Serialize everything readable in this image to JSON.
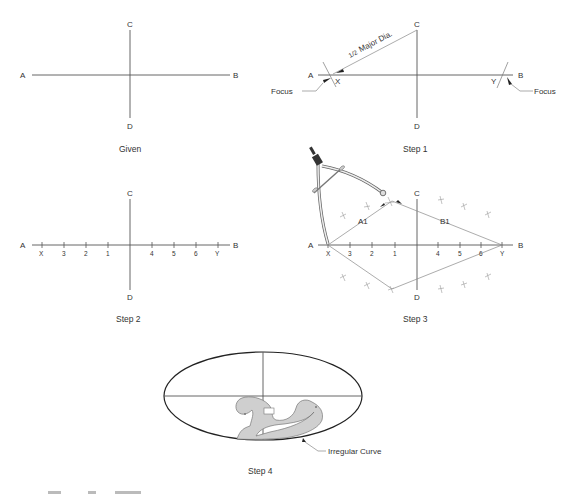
{
  "figure": {
    "panels": [
      {
        "id": "given",
        "caption": "Given",
        "labels": {
          "A": "A",
          "B": "B",
          "C": "C",
          "D": "D"
        }
      },
      {
        "id": "step1",
        "caption": "Step 1",
        "labels": {
          "A": "A",
          "B": "B",
          "C": "C",
          "D": "D",
          "X": "X",
          "Y": "Y"
        },
        "annotation": "½ Major Dia.",
        "annotation_frac": "1/2",
        "annotation_text": "Major Dia.",
        "focus_left": "Focus",
        "focus_right": "Focus"
      },
      {
        "id": "step2",
        "caption": "Step 2",
        "labels": {
          "A": "A",
          "B": "B",
          "C": "C",
          "D": "D"
        },
        "ticks": [
          "X",
          "3",
          "2",
          "1",
          "4",
          "5",
          "6",
          "Y"
        ]
      },
      {
        "id": "step3",
        "caption": "Step 3",
        "labels": {
          "A": "A",
          "B": "B",
          "C": "C",
          "D": "D",
          "A1": "A1",
          "B1": "B1"
        },
        "ticks": [
          "X",
          "3",
          "2",
          "1",
          "4",
          "5",
          "6",
          "Y"
        ],
        "tool": "compass"
      },
      {
        "id": "step4",
        "caption": "Step 4",
        "callout": "Irregular Curve"
      }
    ],
    "colors": {
      "line": "#555555",
      "curve_fill": "#cfcfcf",
      "ellipse": "#222222",
      "text": "#333333"
    }
  }
}
